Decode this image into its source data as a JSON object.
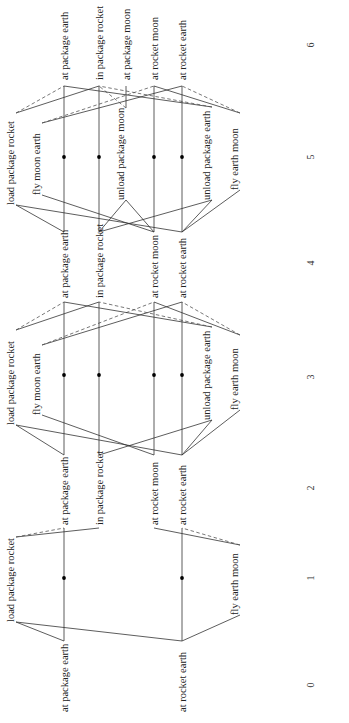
{
  "levels": [
    {
      "index": 0,
      "label": "0",
      "kind": "facts",
      "y_text": 685
    },
    {
      "index": 1,
      "label": "1",
      "kind": "actions",
      "y_text": 578
    },
    {
      "index": 2,
      "label": "2",
      "kind": "facts",
      "y_text": 488
    },
    {
      "index": 3,
      "label": "3",
      "kind": "actions",
      "y_text": 377
    },
    {
      "index": 4,
      "label": "4",
      "kind": "facts",
      "y_text": 263
    },
    {
      "index": 5,
      "label": "5",
      "kind": "actions",
      "y_text": 157
    },
    {
      "index": 6,
      "label": "6",
      "kind": "facts",
      "y_text": 45
    }
  ],
  "fact_columns": {
    "at package earth": 64,
    "in package rocket": 99,
    "at package moon": 126,
    "at rocket moon": 154,
    "at rocket earth": 182
  },
  "fact_layers": [
    {
      "level": 0,
      "y_top": 641,
      "y_label": 650,
      "facts": [
        "at package earth",
        "at rocket earth"
      ]
    },
    {
      "level": 2,
      "y_top": 528,
      "y_label": 534,
      "facts": [
        "at package earth",
        "in package rocket",
        "at rocket moon",
        "at rocket earth"
      ]
    },
    {
      "level": 4,
      "y_top": 302,
      "y_label": 306,
      "facts": [
        "at package earth",
        "in package rocket",
        "at rocket moon",
        "at rocket earth"
      ]
    },
    {
      "level": 6,
      "y_top": 86,
      "y_label": 80,
      "facts": [
        "at package earth",
        "in package rocket",
        "at package moon",
        "at rocket moon",
        "at rocket earth"
      ]
    }
  ],
  "action_layers": [
    {
      "level": 1,
      "noop_y": 578,
      "noops": [
        "at package earth",
        "at rocket earth"
      ],
      "actions": [
        {
          "name": "load package rocket",
          "x": 16,
          "y_eff": 537,
          "y_pre": 622,
          "pre": [
            "at package earth",
            "at rocket earth"
          ],
          "add": [
            "in package rocket"
          ],
          "del": [
            "at package earth"
          ]
        },
        {
          "name": "fly earth moon",
          "x": 240,
          "y_eff": 545,
          "y_pre": 615,
          "pre": [
            "at rocket earth"
          ],
          "add": [
            "at rocket moon"
          ],
          "del": [
            "at rocket earth"
          ]
        }
      ]
    },
    {
      "level": 3,
      "noop_y": 375,
      "noops": [
        "at package earth",
        "in package rocket",
        "at rocket moon",
        "at rocket earth"
      ],
      "actions": [
        {
          "name": "load package rocket",
          "x": 16,
          "y_eff": 330,
          "y_pre": 425,
          "pre": [
            "at package earth",
            "at rocket earth"
          ],
          "add": [
            "in package rocket"
          ],
          "del": [
            "at package earth"
          ]
        },
        {
          "name": "fly moon earth",
          "x": 42,
          "y_eff": 345,
          "y_pre": 415,
          "pre": [
            "at rocket moon"
          ],
          "add": [
            "at rocket earth"
          ],
          "del": [
            "at rocket moon"
          ]
        },
        {
          "name": "unload package earth",
          "x": 212,
          "y_eff": 327,
          "y_pre": 420,
          "pre": [
            "in package rocket",
            "at rocket earth"
          ],
          "add": [
            "at package earth"
          ],
          "del": [
            "in package rocket"
          ]
        },
        {
          "name": "fly earth moon",
          "x": 240,
          "y_eff": 335,
          "y_pre": 410,
          "pre": [
            "at rocket earth"
          ],
          "add": [
            "at rocket moon"
          ],
          "del": [
            "at rocket earth"
          ]
        }
      ]
    },
    {
      "level": 5,
      "noop_y": 157,
      "noops": [
        "at package earth",
        "in package rocket",
        "at rocket moon",
        "at rocket earth"
      ],
      "actions": [
        {
          "name": "load package rocket",
          "x": 16,
          "y_eff": 113,
          "y_pre": 205,
          "pre": [
            "at package earth",
            "at rocket earth"
          ],
          "add": [
            "in package rocket"
          ],
          "del": [
            "at package earth"
          ]
        },
        {
          "name": "fly moon earth",
          "x": 42,
          "y_eff": 123,
          "y_pre": 195,
          "pre": [
            "at rocket moon"
          ],
          "add": [
            "at rocket earth"
          ],
          "del": [
            "at rocket moon"
          ]
        },
        {
          "name": "unload package moon",
          "x": 126,
          "y_eff": 108,
          "y_pre": 200,
          "pre": [
            "in package rocket",
            "at rocket moon"
          ],
          "add": [
            "at package moon"
          ],
          "del": [
            "in package rocket"
          ]
        },
        {
          "name": "unload package earth",
          "x": 212,
          "y_eff": 107,
          "y_pre": 200,
          "pre": [
            "in package rocket",
            "at rocket earth"
          ],
          "add": [
            "at package earth"
          ],
          "del": [
            "in package rocket"
          ]
        },
        {
          "name": "fly earth moon",
          "x": 240,
          "y_eff": 113,
          "y_pre": 190,
          "pre": [
            "at rocket earth"
          ],
          "add": [
            "at rocket moon"
          ],
          "del": [
            "at rocket earth"
          ]
        }
      ]
    }
  ],
  "level_axis_x": 310,
  "colors": {
    "line": "#333333",
    "dashed": "#555555",
    "text": "#222222",
    "background": "#ffffff"
  }
}
